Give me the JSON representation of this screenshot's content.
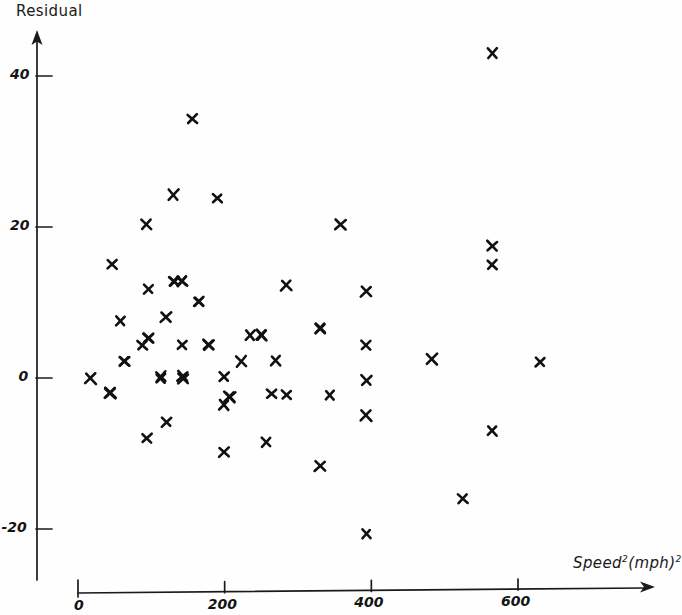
{
  "chart_data": {
    "type": "scatter",
    "title": "",
    "subtitle": "",
    "xlabel": "Speed²(mph)²",
    "xlabel_base": "Speed",
    "xlabel_sup1": "2",
    "xlabel_mid": "(mph)",
    "xlabel_sup2": "2",
    "ylabel": "Residual",
    "xlim": [
      0,
      680
    ],
    "ylim": [
      -27,
      47
    ],
    "xticks": [
      0,
      200,
      400,
      600
    ],
    "xtick_labels": [
      "0",
      "200",
      "400",
      "600"
    ],
    "yticks": [
      -20,
      0,
      20,
      40
    ],
    "ytick_labels": [
      "-20",
      "0",
      "20",
      "40"
    ],
    "grid": false,
    "legend": "none",
    "marker": "x",
    "marker_color": "#111111",
    "axis_color": "#1a1a1a",
    "background_color": "#fefefe",
    "n_points": 62,
    "points": [
      [
        565,
        43.0
      ],
      [
        156,
        34.3
      ],
      [
        130,
        24.3
      ],
      [
        190,
        23.8
      ],
      [
        93,
        20.3
      ],
      [
        358,
        20.3
      ],
      [
        565,
        17.5
      ],
      [
        565,
        15.0
      ],
      [
        46,
        15.1
      ],
      [
        96,
        11.8
      ],
      [
        131,
        12.8
      ],
      [
        142,
        12.8
      ],
      [
        284,
        12.2
      ],
      [
        393,
        11.4
      ],
      [
        165,
        10.1
      ],
      [
        58,
        7.6
      ],
      [
        120,
        8.0
      ],
      [
        96,
        5.3
      ],
      [
        250,
        5.7
      ],
      [
        330,
        6.6
      ],
      [
        88,
        4.4
      ],
      [
        142,
        4.4
      ],
      [
        178,
        4.4
      ],
      [
        393,
        4.4
      ],
      [
        483,
        2.5
      ],
      [
        63,
        2.2
      ],
      [
        223,
        2.2
      ],
      [
        630,
        2.1
      ],
      [
        17,
        -0.1
      ],
      [
        113,
        0.2
      ],
      [
        143,
        -0.1
      ],
      [
        199,
        0.2
      ],
      [
        393,
        -0.3
      ],
      [
        44,
        -2.0
      ],
      [
        207,
        -2.5
      ],
      [
        264,
        -2.1
      ],
      [
        344,
        -2.3
      ],
      [
        120,
        -5.8
      ],
      [
        199,
        -3.6
      ],
      [
        393,
        -5.0
      ],
      [
        94,
        -8.0
      ],
      [
        257,
        -8.5
      ],
      [
        199,
        -9.8
      ],
      [
        565,
        -7.0
      ],
      [
        330,
        -11.7
      ],
      [
        525,
        -16.0
      ],
      [
        393,
        -20.6
      ],
      [
        96,
        5.3
      ],
      [
        165,
        10.1
      ],
      [
        235,
        5.7
      ],
      [
        270,
        2.3
      ],
      [
        143,
        0.2
      ],
      [
        113,
        -0.1
      ],
      [
        63,
        2.2
      ],
      [
        284,
        -2.2
      ],
      [
        330,
        6.6
      ],
      [
        207,
        -2.5
      ],
      [
        178,
        4.4
      ],
      [
        250,
        5.7
      ],
      [
        142,
        12.8
      ],
      [
        131,
        12.8
      ],
      [
        44,
        -2.0
      ]
    ]
  }
}
